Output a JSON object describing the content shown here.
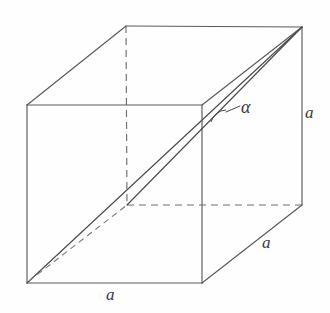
{
  "figure": {
    "background_color": "#fefefe",
    "line_color": "#5a5a5e",
    "label_color": "#39393d"
  },
  "geometry": {
    "shape": "cube",
    "projection": "oblique-parallel",
    "vertices": {
      "front_top_left": [
        27,
        105
      ],
      "front_top_right": [
        202,
        105
      ],
      "front_bottom_left": [
        27,
        283
      ],
      "front_bottom_right": [
        202,
        283
      ],
      "back_top_left": [
        126,
        26
      ],
      "back_top_right": [
        302,
        27
      ],
      "back_bottom_left": [
        127,
        205
      ],
      "back_bottom_right": [
        302,
        205
      ]
    },
    "hidden_vertex": "back_bottom_left",
    "edges_visible": [
      [
        "front_top_left",
        "front_top_right"
      ],
      [
        "front_top_right",
        "front_bottom_right"
      ],
      [
        "front_bottom_right",
        "front_bottom_left"
      ],
      [
        "front_bottom_left",
        "front_top_left"
      ],
      [
        "back_top_left",
        "back_top_right"
      ],
      [
        "back_top_right",
        "back_bottom_right"
      ],
      [
        "front_top_left",
        "back_top_left"
      ],
      [
        "front_top_right",
        "back_top_right"
      ],
      [
        "front_bottom_right",
        "back_bottom_right"
      ]
    ],
    "edges_hidden": [
      [
        "back_top_left",
        "back_bottom_left"
      ],
      [
        "back_bottom_left",
        "back_bottom_right"
      ]
    ],
    "space_diagonal": [
      "front_bottom_left",
      "back_top_right"
    ],
    "face_diagonal_hidden": [
      "front_bottom_left",
      "back_bottom_left"
    ],
    "face_diagonal_visible": [
      "back_bottom_left",
      "back_top_right"
    ],
    "angle_vertex": "back_top_right",
    "angle_mark_position": [
      218,
      113
    ]
  },
  "labels": {
    "edge_bottom_front": "a",
    "edge_bottom_right": "a",
    "edge_vertical_right": "a",
    "angle": "α"
  },
  "annotations": {
    "leader_from": [
      228,
      110
    ],
    "leader_to": [
      240,
      106
    ]
  }
}
